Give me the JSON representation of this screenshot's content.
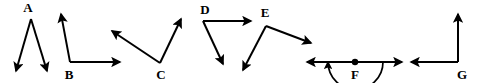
{
  "figure": {
    "width": 480,
    "height": 83,
    "background_color": "#ffffff",
    "stroke_color": "#000000"
  },
  "angles": [
    {
      "id": "A",
      "label": "A",
      "label_x": 28,
      "label_y": 12,
      "vertex": {
        "x": 31,
        "y": 19
      },
      "description": "acute angle opening downward, two rays pointing down",
      "rays": [
        {
          "name": "ray-down-left",
          "x1": 31,
          "y1": 19,
          "x2": 16,
          "y2": 71
        },
        {
          "name": "ray-down-right",
          "x1": 31,
          "y1": 19,
          "x2": 47,
          "y2": 71
        }
      ],
      "arc": null,
      "dot": false
    },
    {
      "id": "B",
      "label": "B",
      "label_x": 69,
      "label_y": 79,
      "vertex": {
        "x": 70,
        "y": 62
      },
      "description": "acute to right angle, one ray up-left, one ray horizontal right",
      "rays": [
        {
          "name": "ray-up",
          "x1": 70,
          "y1": 62,
          "x2": 61,
          "y2": 14
        },
        {
          "name": "ray-right",
          "x1": 70,
          "y1": 62,
          "x2": 120,
          "y2": 62
        }
      ],
      "arc": null,
      "dot": false
    },
    {
      "id": "C",
      "label": "C",
      "label_x": 161,
      "label_y": 79,
      "vertex": {
        "x": 160,
        "y": 63
      },
      "description": "obtuse angle, one ray up-left, one ray up-right",
      "rays": [
        {
          "name": "ray-up-left",
          "x1": 160,
          "y1": 63,
          "x2": 112,
          "y2": 31
        },
        {
          "name": "ray-up-right",
          "x1": 160,
          "y1": 63,
          "x2": 181,
          "y2": 19
        }
      ],
      "arc": null,
      "dot": false
    },
    {
      "id": "D",
      "label": "D",
      "label_x": 205,
      "label_y": 14,
      "vertex": {
        "x": 203,
        "y": 21
      },
      "description": "acute angle, one ray horizontal right, one ray down-right",
      "rays": [
        {
          "name": "ray-right",
          "x1": 203,
          "y1": 21,
          "x2": 251,
          "y2": 21
        },
        {
          "name": "ray-down-right",
          "x1": 203,
          "y1": 21,
          "x2": 223,
          "y2": 64
        }
      ],
      "arc": null,
      "dot": false
    },
    {
      "id": "E",
      "label": "E",
      "label_x": 265,
      "label_y": 17,
      "vertex": {
        "x": 266,
        "y": 26
      },
      "description": "obtuse angle, one ray down-left, one ray down-right",
      "rays": [
        {
          "name": "ray-down-left",
          "x1": 266,
          "y1": 26,
          "x2": 243,
          "y2": 70
        },
        {
          "name": "ray-down-right",
          "x1": 266,
          "y1": 26,
          "x2": 311,
          "y2": 43
        }
      ],
      "arc": null,
      "dot": false
    },
    {
      "id": "F",
      "label": "F",
      "label_x": 355,
      "label_y": 79,
      "vertex": {
        "x": 355,
        "y": 62
      },
      "description": "straight angle of 180 degrees on a line, marked with a semicircular arc and a vertex dot",
      "rays": [
        {
          "name": "ray-left",
          "x1": 355,
          "y1": 62,
          "x2": 307,
          "y2": 62
        },
        {
          "name": "ray-right",
          "x1": 355,
          "y1": 62,
          "x2": 402,
          "y2": 62
        }
      ],
      "arc": {
        "start_x": 328,
        "start_y": 62,
        "end_x": 383,
        "end_y": 62,
        "radius": 27.5
      },
      "dot": true
    },
    {
      "id": "G",
      "label": "G",
      "label_x": 462,
      "label_y": 79,
      "vertex": {
        "x": 458,
        "y": 62
      },
      "description": "right angle, one ray vertical up, one ray horizontal left",
      "rays": [
        {
          "name": "ray-up",
          "x1": 458,
          "y1": 62,
          "x2": 458,
          "y2": 14
        },
        {
          "name": "ray-left",
          "x1": 458,
          "y1": 62,
          "x2": 411,
          "y2": 62
        }
      ],
      "arc": null,
      "dot": false
    }
  ]
}
